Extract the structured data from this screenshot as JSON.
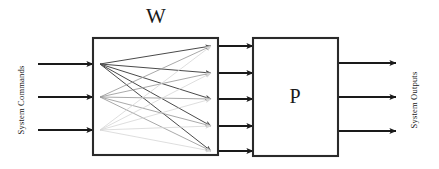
{
  "diagram": {
    "type": "block-diagram",
    "title_w": "W",
    "title_p": "P",
    "left_label": "System Commands",
    "right_label": "System Outputs",
    "colors": {
      "stroke": "#1a1a1a",
      "box_border": "#2a2a2a",
      "background": "#ffffff",
      "fan_dark": "#4a4a4a",
      "fan_medium": "#9a9a9a",
      "fan_light": "#d6d6d6"
    },
    "boxes": [
      {
        "name": "W",
        "label": "W",
        "x": 93,
        "y": 38,
        "width": 125,
        "height": 117
      },
      {
        "name": "P",
        "label": "P",
        "x": 253,
        "y": 38,
        "width": 85,
        "height": 118
      }
    ],
    "input_arrows": {
      "count": 3,
      "y_positions": [
        64,
        97,
        130
      ],
      "x_start": 38,
      "x_end": 93
    },
    "middle_arrows": {
      "count": 5,
      "y_positions": [
        46,
        73,
        99,
        126,
        151
      ],
      "x_start": 218,
      "x_end": 253
    },
    "output_arrows": {
      "count": 3,
      "y_positions": [
        63,
        97,
        131
      ],
      "x_start": 338,
      "x_end": 396
    },
    "fan_sources": [
      {
        "index": 0,
        "y": 64,
        "shade": "dark"
      },
      {
        "index": 1,
        "y": 97,
        "shade": "medium"
      },
      {
        "index": 2,
        "y": 130,
        "shade": "light"
      }
    ],
    "fan_targets": [
      {
        "index": 0,
        "y": 46
      },
      {
        "index": 1,
        "y": 73
      },
      {
        "index": 2,
        "y": 99
      },
      {
        "index": 3,
        "y": 126
      },
      {
        "index": 4,
        "y": 151
      }
    ],
    "fan_connection_count": 15
  }
}
